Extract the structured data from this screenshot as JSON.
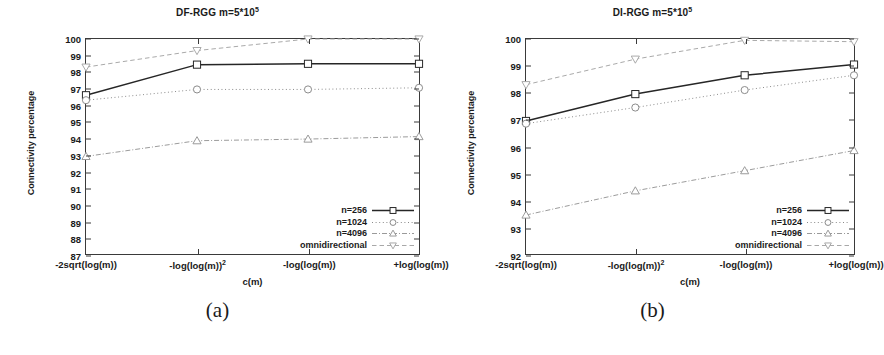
{
  "figure": {
    "panels": [
      {
        "id": "a",
        "caption": "(a)",
        "title_main": "DF-RGG m=5*10",
        "title_sup": "5"
      },
      {
        "id": "b",
        "caption": "(b)",
        "title_main": "DI-RGG m=5*10",
        "title_sup": "5"
      }
    ],
    "axis": {
      "ylabel": "Connectivity percentage",
      "xlabel": "c(m)"
    },
    "legend": {
      "entries": [
        {
          "label": "n=256",
          "marker": "square-marker",
          "color": "#262626",
          "dash": "solid"
        },
        {
          "label": "n=1024",
          "marker": "circle-marker",
          "color": "#8a8a8a",
          "dash": "dotted"
        },
        {
          "label": "n=4096",
          "marker": "triangle-up-marker",
          "color": "#9a9a9a",
          "dash": "dashdot"
        },
        {
          "label": "omnidirectional",
          "marker": "triangle-down-marker",
          "color": "#a8a8a8",
          "dash": "dashed"
        }
      ]
    }
  },
  "chart_data": [
    {
      "type": "line",
      "panel": "a",
      "title": "DF-RGG m=5*10^5",
      "xlabel": "c(m)",
      "ylabel": "Connectivity percentage",
      "categories": [
        "-2sqrt(log(m))",
        "-log(log(m))^2",
        "-log(log(m))",
        "+log(log(m))"
      ],
      "xtick_labels": [
        "-2sqrt(log(m))",
        "-log(log(m))",
        "-log(log(m))",
        "+log(log(m))"
      ],
      "xtick_sup": [
        "",
        "2",
        "",
        ""
      ],
      "ylim": [
        87,
        100
      ],
      "ytick_values": [
        87,
        88,
        89,
        90,
        91,
        92,
        93,
        94,
        95,
        96,
        97,
        98,
        99,
        100
      ],
      "grid": false,
      "legend_position": "bottom-right",
      "series": [
        {
          "name": "n=256",
          "values": [
            96.6,
            98.45,
            98.5,
            98.5
          ]
        },
        {
          "name": "n=1024",
          "values": [
            96.3,
            96.95,
            96.95,
            97.05
          ]
        },
        {
          "name": "n=4096",
          "values": [
            92.9,
            93.85,
            93.95,
            94.1
          ]
        },
        {
          "name": "omnidirectional",
          "values": [
            98.3,
            99.3,
            100.0,
            100.0
          ]
        }
      ]
    },
    {
      "type": "line",
      "panel": "b",
      "title": "DI-RGG m=5*10^5",
      "xlabel": "c(m)",
      "ylabel": "Connectivity percentage",
      "categories": [
        "-2sqrt(log(m))",
        "-log(log(m))^2",
        "-log(log(m))",
        "+log(log(m))"
      ],
      "xtick_labels": [
        "-2sqrt(log(m))",
        "-log(log(m))",
        "-log(log(m))",
        "+log(log(m))"
      ],
      "xtick_sup": [
        "",
        "2",
        "",
        ""
      ],
      "ylim": [
        92,
        100
      ],
      "ytick_values": [
        92,
        93,
        94,
        95,
        96,
        97,
        98,
        99,
        100
      ],
      "grid": false,
      "legend_position": "bottom-right",
      "series": [
        {
          "name": "n=256",
          "values": [
            96.95,
            97.95,
            98.65,
            99.05
          ]
        },
        {
          "name": "n=1024",
          "values": [
            96.85,
            97.45,
            98.1,
            98.65
          ]
        },
        {
          "name": "n=4096",
          "values": [
            93.45,
            94.35,
            95.1,
            95.85
          ]
        },
        {
          "name": "omnidirectional",
          "values": [
            98.3,
            99.25,
            99.95,
            99.9
          ]
        }
      ]
    }
  ]
}
